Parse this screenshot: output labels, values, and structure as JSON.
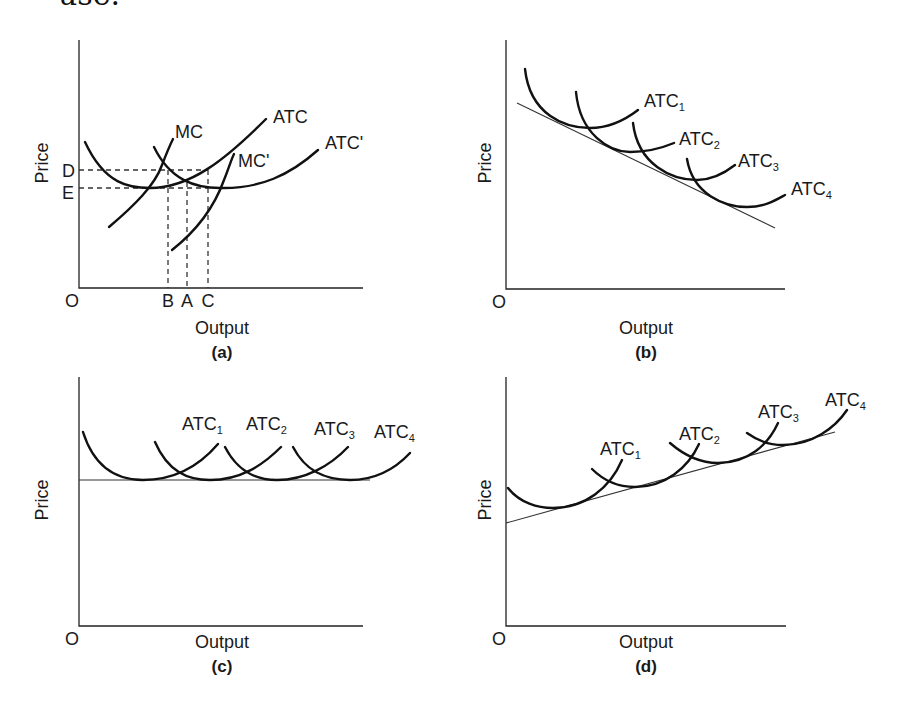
{
  "header_fragment": "use.",
  "colors": {
    "line": "#111111",
    "axis": "#222222",
    "background": "#ffffff"
  },
  "panels": [
    {
      "id": "a",
      "caption": "(a)",
      "xlabel": "Output",
      "ylabel": "Price",
      "origin": "O",
      "axes": {
        "x0": 79,
        "y0": 288,
        "xEnd": 363,
        "yTop": 40
      },
      "ylevels": [
        {
          "label": "D",
          "y": 170,
          "lx": 62,
          "ly": 177
        },
        {
          "label": "E",
          "y": 188,
          "lx": 62,
          "ly": 199
        }
      ],
      "xmarks": [
        {
          "label": "B",
          "x": 168,
          "top": 170
        },
        {
          "label": "A",
          "x": 187,
          "top": 182
        },
        {
          "label": "C",
          "x": 208,
          "top": 170
        }
      ],
      "curves": [
        {
          "name": "ATC",
          "label": "ATC",
          "sub": "",
          "lx": 273,
          "ly": 123,
          "d": "M85,142 C105,185 130,188 150,188 C190,188 225,160 266,119"
        },
        {
          "name": "MC",
          "label": "MC",
          "sub": "",
          "lx": 175,
          "ly": 138,
          "d": "M109,227 C135,205 155,185 162,165 C167,152 170,145 173,139"
        },
        {
          "name": "ATC-prime",
          "label": "ATC'",
          "sub": "",
          "lx": 325,
          "ly": 149,
          "d": "M154,147 C170,180 195,188 220,188 C260,189 290,175 318,150"
        },
        {
          "name": "MC-prime",
          "label": "MC'",
          "sub": "",
          "lx": 238,
          "ly": 167,
          "d": "M172,250 C200,228 215,205 224,180 C229,168 231,160 234,154"
        }
      ]
    },
    {
      "id": "b",
      "caption": "(b)",
      "xlabel": "Output",
      "ylabel": "Price",
      "origin": "O",
      "axes": {
        "x0": 506,
        "y0": 289,
        "xEnd": 785,
        "yTop": 40
      },
      "envelope": {
        "x1": 517,
        "y1": 103,
        "x2": 775,
        "y2": 228
      },
      "curves": [
        {
          "name": "ATC1",
          "label": "ATC",
          "sub": "1",
          "lx": 644,
          "ly": 107,
          "d": "M525,69 C530,115 565,128 590,128 C610,128 625,120 638,110"
        },
        {
          "name": "ATC2",
          "label": "ATC",
          "sub": "2",
          "lx": 679,
          "ly": 145,
          "d": "M576,92 C580,135 610,152 630,152 C648,152 662,148 674,143"
        },
        {
          "name": "ATC3",
          "label": "ATC",
          "sub": "3",
          "lx": 738,
          "ly": 167,
          "d": "M633,123 C638,165 672,180 697,180 C713,180 726,172 735,165"
        },
        {
          "name": "ATC4",
          "label": "ATC",
          "sub": "4",
          "lx": 791,
          "ly": 195,
          "d": "M687,159 C693,195 725,207 747,207 C765,207 776,200 785,195"
        }
      ]
    },
    {
      "id": "c",
      "caption": "(c)",
      "xlabel": "Output",
      "ylabel": "Price",
      "origin": "O",
      "axes": {
        "x0": 79,
        "y0": 626,
        "xEnd": 363,
        "yTop": 377
      },
      "envelope": {
        "x1": 79,
        "y1": 480,
        "x2": 370,
        "y2": 480
      },
      "curves": [
        {
          "name": "ATC1",
          "label": "ATC",
          "sub": "1",
          "lx": 182,
          "ly": 430,
          "d": "M83,432 C95,470 120,480 143,480 C175,480 200,465 218,444"
        },
        {
          "name": "ATC2",
          "label": "ATC",
          "sub": "2",
          "lx": 246,
          "ly": 430,
          "d": "M155,442 C168,472 188,480 210,480 C240,480 262,466 281,447"
        },
        {
          "name": "ATC3",
          "label": "ATC",
          "sub": "3",
          "lx": 314,
          "ly": 435,
          "d": "M225,447 C238,472 256,480 277,480 C305,480 330,466 348,447"
        },
        {
          "name": "ATC4",
          "label": "ATC",
          "sub": "4",
          "lx": 374,
          "ly": 438,
          "d": "M293,447 C306,472 326,480 350,480 C378,480 396,468 410,453"
        }
      ]
    },
    {
      "id": "d",
      "caption": "(d)",
      "xlabel": "Output",
      "ylabel": "Price",
      "origin": "O",
      "axes": {
        "x0": 506,
        "y0": 626,
        "xEnd": 786,
        "yTop": 377
      },
      "envelope": {
        "x1": 506,
        "y1": 523,
        "x2": 835,
        "y2": 432
      },
      "curves": [
        {
          "name": "ATC1",
          "label": "ATC",
          "sub": "1",
          "lx": 600,
          "ly": 455,
          "d": "M508,488 C520,503 538,508 553,508 C585,508 610,488 622,460"
        },
        {
          "name": "ATC2",
          "label": "ATC",
          "sub": "2",
          "lx": 679,
          "ly": 440,
          "d": "M592,469 C605,482 620,487 635,487 C665,487 688,468 699,444"
        },
        {
          "name": "ATC3",
          "label": "ATC",
          "sub": "3",
          "lx": 758,
          "ly": 418,
          "d": "M670,443 C685,456 700,463 718,463 C748,463 768,445 778,423"
        },
        {
          "name": "ATC4",
          "label": "ATC",
          "sub": "4",
          "lx": 825,
          "ly": 406,
          "d": "M747,433 C758,441 770,445 783,445 C812,445 835,428 847,410"
        }
      ]
    }
  ],
  "chart_data": {
    "type": "diagram",
    "panels": [
      {
        "id": "a",
        "xlabel": "Output",
        "ylabel": "Price",
        "series": [
          "ATC",
          "MC",
          "ATC'",
          "MC'"
        ],
        "price_levels": [
          "D",
          "E"
        ],
        "output_levels": [
          "B",
          "A",
          "C"
        ]
      },
      {
        "id": "b",
        "xlabel": "Output",
        "ylabel": "Price",
        "series": [
          "ATC1",
          "ATC2",
          "ATC3",
          "ATC4"
        ],
        "envelope": "downward sloping (economies of scale)"
      },
      {
        "id": "c",
        "xlabel": "Output",
        "ylabel": "Price",
        "series": [
          "ATC1",
          "ATC2",
          "ATC3",
          "ATC4"
        ],
        "envelope": "horizontal (constant returns)"
      },
      {
        "id": "d",
        "xlabel": "Output",
        "ylabel": "Price",
        "series": [
          "ATC1",
          "ATC2",
          "ATC3",
          "ATC4"
        ],
        "envelope": "upward sloping (diseconomies of scale)"
      }
    ]
  }
}
